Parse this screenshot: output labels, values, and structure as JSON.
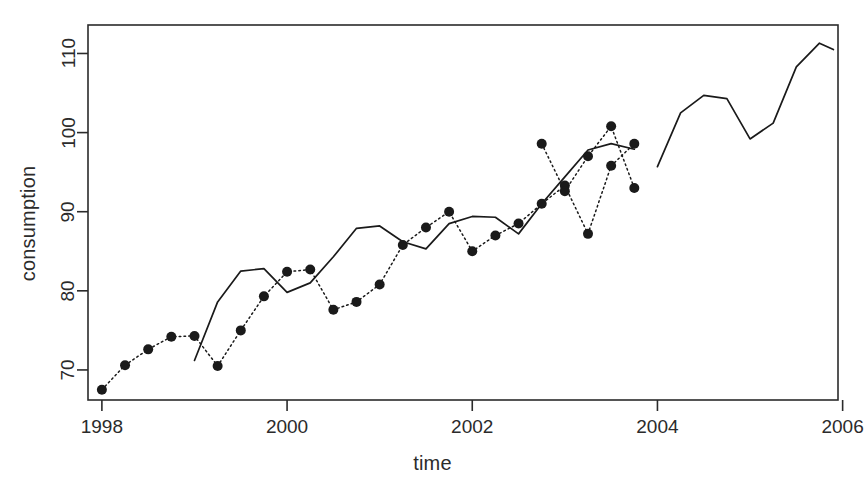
{
  "chart_data": {
    "type": "line",
    "title": "",
    "xlabel": "time",
    "ylabel": "consumption",
    "xlim": [
      1997.85,
      2005.95
    ],
    "ylim": [
      66.2,
      113.6
    ],
    "xticks": [
      1998,
      2000,
      2002,
      2004,
      2006
    ],
    "xtick_labels": [
      "1998",
      "2000",
      "2002",
      "2004",
      "2006"
    ],
    "yticks": [
      70,
      80,
      90,
      100,
      110
    ],
    "ytick_labels": [
      "70",
      "80",
      "90",
      "100",
      "110"
    ],
    "grid": false,
    "legend": "none",
    "box": true,
    "series": [
      {
        "name": "observed",
        "style": "dotted-with-points",
        "marker": "filled-circle",
        "color": "#1a1a1a",
        "x": [
          1998.0,
          1998.25,
          1998.5,
          1998.75,
          1999.0,
          1999.25,
          1999.5,
          1999.75,
          2000.0,
          2000.25,
          2000.5,
          2000.75,
          2001.0,
          2001.25,
          2001.5,
          2001.75,
          2002.0,
          2002.25,
          2002.5,
          2002.75,
          2003.0,
          2003.25,
          2003.5,
          2003.75
        ],
        "values": [
          67.5,
          70.6,
          72.6,
          74.2,
          74.3,
          70.5,
          75.0,
          79.3,
          82.4,
          82.7,
          77.6,
          78.6,
          80.8,
          85.8,
          88.0,
          90.0,
          85.0,
          87.0,
          88.5,
          91.0,
          93.3,
          87.2,
          95.8,
          98.6
        ]
      },
      {
        "name": "observed_tail",
        "style": "dotted-with-points",
        "marker": "filled-circle",
        "color": "#1a1a1a",
        "x": [
          2002.75,
          2003.0,
          2003.25,
          2003.5,
          2003.75
        ],
        "values": [
          98.6,
          92.6,
          97.0,
          100.8,
          93.0
        ]
      },
      {
        "name": "fitted",
        "style": "solid",
        "color": "#1a1a1a",
        "x": [
          1999.0,
          1999.25,
          1999.5,
          1999.75,
          2000.0,
          2000.25,
          2000.5,
          2000.75,
          2001.0,
          2001.25,
          2001.5,
          2001.75,
          2002.0,
          2002.25,
          2002.5,
          2002.75,
          2003.0,
          2003.25,
          2003.5,
          2003.75
        ],
        "values": [
          71.2,
          78.6,
          82.5,
          82.8,
          79.8,
          81.0,
          84.3,
          87.9,
          88.2,
          86.2,
          85.3,
          88.5,
          89.4,
          89.3,
          87.2,
          91.0,
          94.4,
          97.8,
          98.6,
          97.9
        ]
      },
      {
        "name": "forecast",
        "style": "solid",
        "color": "#1a1a1a",
        "x": [
          2004.0,
          2004.25,
          2004.5,
          2004.75,
          2005.0,
          2005.25,
          2005.5,
          2005.75,
          2005.9
        ],
        "values": [
          95.7,
          102.5,
          104.7,
          104.3,
          99.2,
          101.2,
          108.3,
          111.3,
          110.5
        ]
      }
    ]
  }
}
